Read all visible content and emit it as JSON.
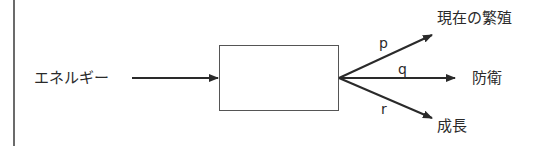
{
  "diagram": {
    "input_label": "エネルギー",
    "outputs": [
      {
        "id": "p",
        "coefficient": "p",
        "label": "現在の繁殖"
      },
      {
        "id": "q",
        "coefficient": "q",
        "label": "防衛"
      },
      {
        "id": "r",
        "coefficient": "r",
        "label": "成長"
      }
    ],
    "colors": {
      "stroke": "#2a2a2a",
      "background": "#ffffff"
    }
  }
}
